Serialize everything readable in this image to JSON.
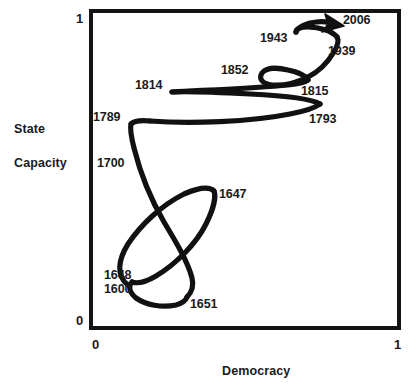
{
  "figure": {
    "background_color": "#ffffff",
    "line_color": "#111111",
    "text_color": "#1a1a1a"
  },
  "axes": {
    "x_title": "Democracy",
    "y_title_line1": "State",
    "y_title_line2": "Capacity",
    "x_tick_min": "0",
    "x_tick_max": "1",
    "y_tick_min": "0",
    "y_tick_max": "1"
  },
  "annotations": [
    {
      "id": "y1600",
      "label": "1600",
      "left": 104,
      "top": 282
    },
    {
      "id": "y1647",
      "label": "1647",
      "left": 219,
      "top": 187
    },
    {
      "id": "y1648",
      "label": "1648",
      "left": 104,
      "top": 268
    },
    {
      "id": "y1651",
      "label": "1651",
      "left": 190,
      "top": 297
    },
    {
      "id": "y1700",
      "label": "1700",
      "left": 97,
      "top": 156
    },
    {
      "id": "y1789",
      "label": "1789",
      "left": 93,
      "top": 110
    },
    {
      "id": "y1793",
      "label": "1793",
      "left": 309,
      "top": 112
    },
    {
      "id": "y1814",
      "label": "1814",
      "left": 135,
      "top": 78
    },
    {
      "id": "y1815",
      "label": "1815",
      "left": 301,
      "top": 84
    },
    {
      "id": "y1852",
      "label": "1852",
      "left": 221,
      "top": 63
    },
    {
      "id": "y1939",
      "label": "1939",
      "left": 328,
      "top": 44
    },
    {
      "id": "y1943",
      "label": "1943",
      "left": 260,
      "top": 31
    },
    {
      "id": "y2006",
      "label": "2006",
      "left": 343,
      "top": 13
    }
  ],
  "chart_data": {
    "type": "line",
    "title": "",
    "xlabel": "Democracy",
    "ylabel": "State Capacity",
    "xlim": [
      0,
      1
    ],
    "ylim": [
      0,
      1
    ],
    "grid": false,
    "legend": null,
    "series": [
      {
        "name": "England trajectory",
        "comment": "Conceptual trajectory through Democracy (x) / State Capacity (y) space, normalized 0-1, traced chronologically 1600 -> 2006.",
        "points": [
          {
            "year": 1600,
            "x": 0.12,
            "y": 0.135
          },
          {
            "year": 1620,
            "x": 0.1,
            "y": 0.2
          },
          {
            "year": 1640,
            "x": 0.18,
            "y": 0.35
          },
          {
            "year": 1647,
            "x": 0.4,
            "y": 0.44
          },
          {
            "year": 1648,
            "x": 0.13,
            "y": 0.16
          },
          {
            "year": 1651,
            "x": 0.28,
            "y": 0.09
          },
          {
            "year": 1660,
            "x": 0.42,
            "y": 0.2
          },
          {
            "year": 1680,
            "x": 0.36,
            "y": 0.36
          },
          {
            "year": 1700,
            "x": 0.2,
            "y": 0.52
          },
          {
            "year": 1789,
            "x": 0.135,
            "y": 0.665
          },
          {
            "year": 1793,
            "x": 0.73,
            "y": 0.705
          },
          {
            "year": 1814,
            "x": 0.275,
            "y": 0.755
          },
          {
            "year": 1815,
            "x": 0.7,
            "y": 0.775
          },
          {
            "year": 1852,
            "x": 0.63,
            "y": 0.815
          },
          {
            "year": 1860,
            "x": 0.69,
            "y": 0.8
          },
          {
            "year": 1939,
            "x": 0.78,
            "y": 0.855
          },
          {
            "year": 1943,
            "x": 0.69,
            "y": 0.905
          },
          {
            "year": 2006,
            "x": 0.82,
            "y": 0.93
          }
        ],
        "has_end_arrow": true
      }
    ]
  }
}
